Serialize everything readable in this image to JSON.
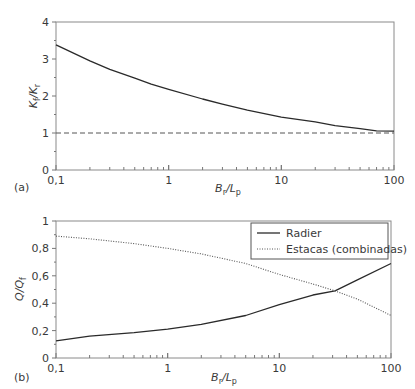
{
  "chart_data": [
    {
      "panel": "(a)",
      "type": "line",
      "title": "",
      "xlabel": "Br/Lp",
      "xlabel_main": "B",
      "xlabel_sub1": "r",
      "xlabel_sep": "/L",
      "xlabel_sub2": "p",
      "ylabel": "Kf/Kr",
      "ylabel_main1": "K",
      "ylabel_sub1": "f",
      "ylabel_sep": "/K",
      "ylabel_sub2": "r",
      "xscale": "log",
      "xlim": [
        0.1,
        100
      ],
      "ylim": [
        0,
        4
      ],
      "xticks": [
        "0,1",
        "1",
        "10",
        "100"
      ],
      "yticks": [
        "0",
        "1",
        "2",
        "3",
        "4"
      ],
      "grid": false,
      "series": [
        {
          "name": "Kf/Kr",
          "style": "solid",
          "x": [
            0.1,
            0.2,
            0.3,
            0.5,
            0.7,
            1,
            2,
            3,
            5,
            10,
            20,
            30,
            50,
            70,
            100
          ],
          "y": [
            3.38,
            2.95,
            2.72,
            2.48,
            2.32,
            2.18,
            1.92,
            1.78,
            1.62,
            1.43,
            1.3,
            1.2,
            1.12,
            1.06,
            1.05
          ]
        },
        {
          "name": "Reference (1.0)",
          "style": "dashed",
          "x": [
            0.1,
            100
          ],
          "y": [
            1.0,
            1.0
          ]
        }
      ]
    },
    {
      "panel": "(b)",
      "type": "line",
      "title": "",
      "xlabel": "Br/Lp",
      "xlabel_main": "B",
      "xlabel_sub1": "r",
      "xlabel_sep": "/L",
      "xlabel_sub2": "p",
      "ylabel": "Q/Qf",
      "ylabel_main1": "Q",
      "ylabel_sep": "/Q",
      "ylabel_sub2": "f",
      "xscale": "log",
      "xlim": [
        0.1,
        100
      ],
      "ylim": [
        0,
        1
      ],
      "xticks": [
        "0,1",
        "1",
        "10",
        "100"
      ],
      "yticks": [
        "0",
        "0,2",
        "0,4",
        "0,6",
        "0,8",
        "1"
      ],
      "grid": false,
      "legend_position": "upper right",
      "series": [
        {
          "name": "Radier",
          "style": "solid",
          "x": [
            0.1,
            0.2,
            0.5,
            1,
            2,
            5,
            10,
            20,
            31.5,
            50,
            100
          ],
          "y": [
            0.125,
            0.16,
            0.185,
            0.21,
            0.245,
            0.31,
            0.39,
            0.46,
            0.49,
            0.57,
            0.69
          ]
        },
        {
          "name": "Estacas (combinadas)",
          "style": "dotted",
          "x": [
            0.1,
            0.2,
            0.5,
            1,
            2,
            5,
            10,
            20,
            31.5,
            50,
            100
          ],
          "y": [
            0.89,
            0.87,
            0.835,
            0.8,
            0.76,
            0.69,
            0.61,
            0.54,
            0.49,
            0.43,
            0.31
          ]
        }
      ]
    }
  ]
}
